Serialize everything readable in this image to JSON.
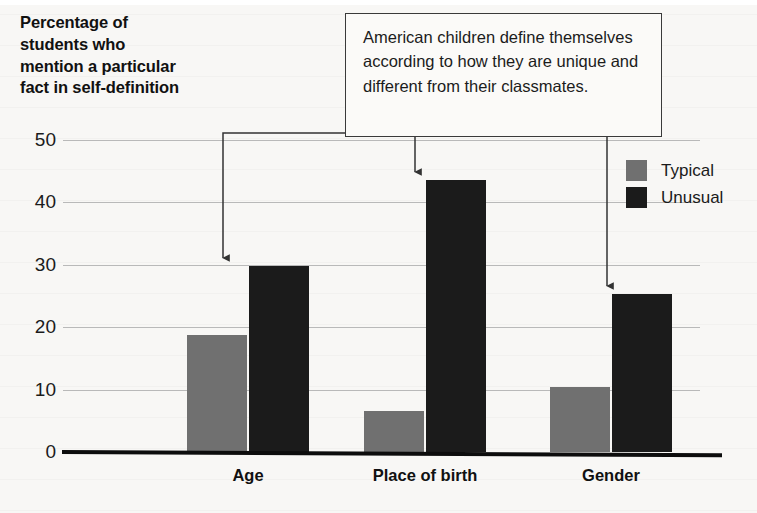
{
  "chart_data": {
    "type": "bar",
    "title": "Percentage of students who mention a particular fact in self-definition",
    "xlabel": "",
    "ylabel": "Percentage of students who mention a particular fact in self-definition",
    "categories": [
      "Age",
      "Place of birth",
      "Gender"
    ],
    "series": [
      {
        "name": "Typical",
        "color": "#707070",
        "values": [
          18.8,
          6.5,
          10.4
        ]
      },
      {
        "name": "Unusual",
        "color": "#1b1b1b",
        "values": [
          29.8,
          43.6,
          25.3
        ]
      }
    ],
    "ylim": [
      0,
      50
    ],
    "yticks": [
      0,
      10,
      20,
      30,
      40,
      50
    ],
    "ytick_labels": [
      "0",
      "10",
      "20",
      "30",
      "40",
      "50"
    ],
    "grid": true,
    "legend_position": "top-right",
    "annotations": [
      {
        "text": "American children define themselves according to how they are unique and different from their classmates.",
        "points_to": [
          "Age / Unusual",
          "Place of birth / Unusual",
          "Gender / Unusual"
        ]
      }
    ]
  },
  "title": {
    "line1": "Percentage of",
    "line2": "students who",
    "line3": "mention a particular",
    "line4": "fact in self-definition",
    "full": "Percentage of students who mention a particular fact in self-definition"
  },
  "y_axis": {
    "ticks": [
      "50",
      "40",
      "30",
      "20",
      "10",
      "0"
    ]
  },
  "x_axis": {
    "categories": [
      "Age",
      "Place of birth",
      "Gender"
    ]
  },
  "legend": {
    "items": [
      {
        "label": "Typical",
        "color": "#707070"
      },
      {
        "label": "Unusual",
        "color": "#1b1b1b"
      }
    ]
  },
  "callout": {
    "text": "American children define themselves according to how they are unique and different from their classmates."
  }
}
